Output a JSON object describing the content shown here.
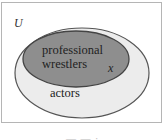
{
  "diagram": {
    "type": "venn",
    "universe_label": "U",
    "sets": [
      {
        "id": "actors",
        "label": "actors",
        "fill": "#ececec",
        "stroke": "#555555",
        "contains": [
          "professional_wrestlers"
        ]
      },
      {
        "id": "professional_wrestlers",
        "label": "professional wrestlers",
        "label_lines": [
          "professional",
          "wrestlers"
        ],
        "fill": "#8e8e8e",
        "stroke": "#444444"
      }
    ],
    "element_label": "x",
    "element_in": "professional_wrestlers",
    "caption": "— — ·"
  }
}
